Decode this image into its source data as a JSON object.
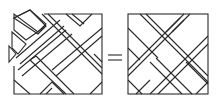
{
  "figure": {
    "relation_symbol": "=",
    "stroke_color": "#2a2a2a",
    "background_color": "#ffffff",
    "left_panel": {
      "label": "pieces",
      "box": [
        14,
        10,
        102,
        95
      ]
    },
    "right_panel": {
      "label": "assembled square",
      "box": [
        128,
        14,
        208,
        94
      ]
    }
  }
}
